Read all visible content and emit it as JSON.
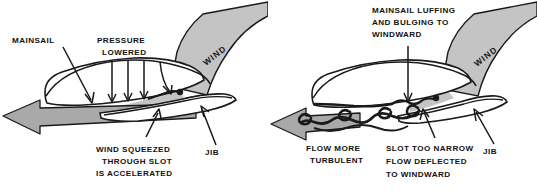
{
  "figure": {
    "title_visible": false,
    "background_color": "#ffffff",
    "ink_color": "#1a1a1a",
    "wind_band_color": "#c4c4c4",
    "arrow_fill_color": "#a9a9a9",
    "panel_count": 2
  },
  "panels": [
    {
      "id": "correct-slot",
      "side": "left",
      "labels": {
        "mainsail": "MAINSAIL",
        "pressure_lowered_line1": "PRESSURE",
        "pressure_lowered_line2": "LOWERED",
        "wind": "WIND",
        "jib": "JIB",
        "slot_note_line1": "WIND SQUEEZED",
        "slot_note_line2": "THROUGH SLOT",
        "slot_note_line3": "IS ACCELERATED"
      },
      "elements": {
        "flow_arrow_direction": "left",
        "pressure_arrow_count": 4,
        "flow_character": "smooth-attached"
      }
    },
    {
      "id": "narrow-slot",
      "side": "right",
      "labels": {
        "mainsail_note_line1": "MAINSAIL LUFFING",
        "mainsail_note_line2": "AND BULGING TO",
        "mainsail_note_line3": "WINDWARD",
        "wind": "WIND",
        "jib": "JIB",
        "flow_note_line1": "FLOW MORE",
        "flow_note_line2": "TURBULENT",
        "slot_note_line1": "SLOT TOO  NARROW",
        "slot_note_line2": "FLOW DEFLECTED",
        "slot_note_line3": "TO WINDWARD"
      },
      "elements": {
        "flow_arrow_direction": "left",
        "vortex_count": 3,
        "flow_character": "turbulent-separated"
      }
    }
  ]
}
